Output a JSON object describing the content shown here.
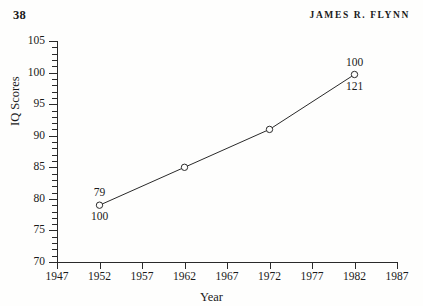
{
  "running_head": {
    "page_number": "38",
    "author": "JAMES R. FLYNN"
  },
  "chart_data": {
    "type": "line",
    "title": "",
    "xlabel": "Year",
    "ylabel": "IQ Scores",
    "xlim": [
      1947,
      1987
    ],
    "ylim": [
      70,
      105
    ],
    "xticks": [
      "1947",
      "1952",
      "1957",
      "1962",
      "1967",
      "1972",
      "1977",
      "1982",
      "1987"
    ],
    "yticks": [
      "70",
      "75",
      "80",
      "85",
      "90",
      "95",
      "100",
      "105"
    ],
    "y_minor_step": 1,
    "grid": false,
    "legend": "none",
    "marker": "open-circle",
    "x": [
      1952,
      1962,
      1972,
      1982
    ],
    "values": [
      79,
      85,
      91,
      99.7
    ],
    "point_annotations": [
      {
        "x": 1952,
        "y": 79,
        "above": "79",
        "below": "100"
      },
      {
        "x": 1962,
        "y": 85,
        "above": "",
        "below": ""
      },
      {
        "x": 1972,
        "y": 91,
        "above": "",
        "below": ""
      },
      {
        "x": 1982,
        "y": 99.7,
        "above": "100",
        "below": "121"
      }
    ],
    "line_color": "#2a2a2a",
    "marker_color": "#2a2a2a",
    "background": "#fefefd"
  }
}
